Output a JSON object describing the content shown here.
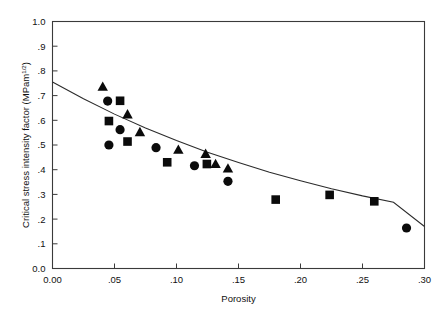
{
  "chart_data": {
    "type": "scatter",
    "title": "",
    "xlabel": "Porosity",
    "ylabel": "Critical stress intensity factor",
    "ylabel_units": "(MPam",
    "ylabel_units_sup": "1/2",
    "ylabel_units_close": ")",
    "xlim": [
      0.0,
      0.3
    ],
    "ylim": [
      0.0,
      1.0
    ],
    "grid": false,
    "legend": "none",
    "xticks": [
      0.0,
      0.05,
      0.1,
      0.15,
      0.2,
      0.25,
      0.3
    ],
    "xticklabels": [
      "0.00",
      ".05",
      ".10",
      ".15",
      ".20",
      ".25",
      ".30"
    ],
    "yticks": [
      0.0,
      0.1,
      0.2,
      0.3,
      0.4,
      0.5,
      0.6,
      0.7,
      0.8,
      0.9,
      1.0
    ],
    "yticklabels": [
      "0.0",
      ".1",
      ".2",
      ".3",
      ".4",
      ".5",
      ".6",
      ".7",
      ".8",
      ".9",
      "1.0"
    ],
    "series": [
      {
        "name": "circle-series",
        "marker": "circle",
        "color": "#0b0b0b",
        "points": [
          {
            "x": 0.0445,
            "y": 0.678
          },
          {
            "x": 0.0455,
            "y": 0.5
          },
          {
            "x": 0.0545,
            "y": 0.562
          },
          {
            "x": 0.0835,
            "y": 0.489
          },
          {
            "x": 0.1145,
            "y": 0.416
          },
          {
            "x": 0.1415,
            "y": 0.353
          },
          {
            "x": 0.2855,
            "y": 0.164
          }
        ]
      },
      {
        "name": "square-series",
        "marker": "square",
        "color": "#0b0b0b",
        "points": [
          {
            "x": 0.0455,
            "y": 0.597
          },
          {
            "x": 0.0545,
            "y": 0.679
          },
          {
            "x": 0.0605,
            "y": 0.514
          },
          {
            "x": 0.0925,
            "y": 0.43
          },
          {
            "x": 0.1245,
            "y": 0.423
          },
          {
            "x": 0.18,
            "y": 0.279
          },
          {
            "x": 0.2235,
            "y": 0.298
          },
          {
            "x": 0.2595,
            "y": 0.272
          }
        ]
      },
      {
        "name": "triangle-series",
        "marker": "triangle",
        "color": "#0b0b0b",
        "points": [
          {
            "x": 0.0405,
            "y": 0.734
          },
          {
            "x": 0.0605,
            "y": 0.622
          },
          {
            "x": 0.0705,
            "y": 0.55
          },
          {
            "x": 0.1015,
            "y": 0.479
          },
          {
            "x": 0.1235,
            "y": 0.462
          },
          {
            "x": 0.1315,
            "y": 0.421
          },
          {
            "x": 0.1415,
            "y": 0.403
          }
        ]
      }
    ],
    "fit_curve": {
      "name": "fitted-trend-curve",
      "color": "#2b2b2b",
      "description": "monotonic decreasing exponential-like fit",
      "points": [
        {
          "x": 0.0,
          "y": 0.755
        },
        {
          "x": 0.025,
          "y": 0.687
        },
        {
          "x": 0.05,
          "y": 0.625
        },
        {
          "x": 0.075,
          "y": 0.569
        },
        {
          "x": 0.1,
          "y": 0.518
        },
        {
          "x": 0.125,
          "y": 0.471
        },
        {
          "x": 0.15,
          "y": 0.429
        },
        {
          "x": 0.175,
          "y": 0.39
        },
        {
          "x": 0.2,
          "y": 0.355
        },
        {
          "x": 0.225,
          "y": 0.323
        },
        {
          "x": 0.25,
          "y": 0.294
        },
        {
          "x": 0.275,
          "y": 0.268
        },
        {
          "x": 0.3,
          "y": 0.17
        }
      ]
    }
  }
}
